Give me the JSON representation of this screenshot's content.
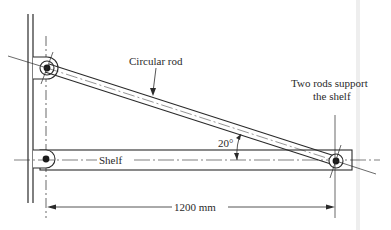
{
  "figure": {
    "labels": {
      "rod": "Circular rod",
      "support_line1": "Two rods support",
      "support_line2": "the shelf",
      "shelf": "Shelf",
      "angle": "20°",
      "dimension": "1200 mm"
    },
    "geometry": {
      "span_mm": 1200,
      "rod_angle_deg": 20
    },
    "colors": {
      "ink": "#2a2a2a",
      "background": "#ffffff",
      "page_edge": "#e6e6e6"
    }
  }
}
